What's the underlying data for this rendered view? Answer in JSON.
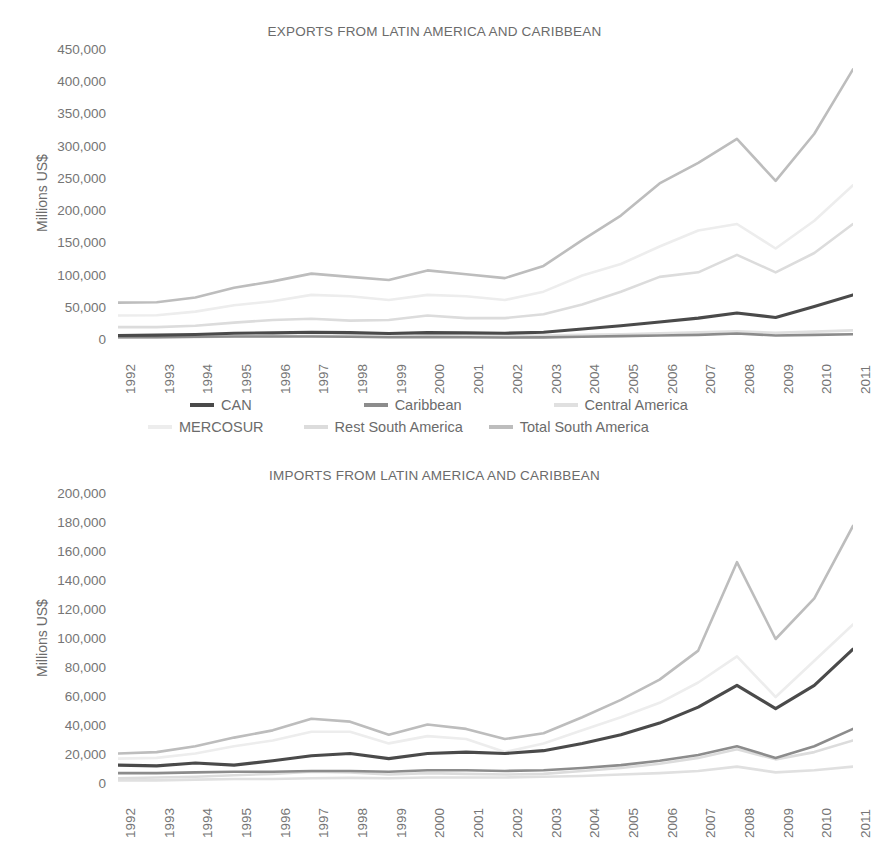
{
  "charts": [
    {
      "id": "exports",
      "title": "EXPORTS FROM LATIN AMERICA AND CARIBBEAN",
      "ylabel": "Millions US$"
    },
    {
      "id": "imports",
      "title": "IMPORTS FROM LATIN AMERICA AND CARIBBEAN",
      "ylabel": "Millions US$"
    }
  ],
  "legend": {
    "row1": [
      {
        "label": "CAN",
        "color": "#4a4a4a"
      },
      {
        "label": "Caribbean",
        "color": "#8c8c8c"
      },
      {
        "label": "Central America",
        "color": "#e0e0e0"
      }
    ],
    "row2": [
      {
        "label": "MERCOSUR",
        "color": "#ededed"
      },
      {
        "label": "Rest South America",
        "color": "#dcdcdc"
      },
      {
        "label": "Total South America",
        "color": "#bdbdbd"
      }
    ]
  },
  "chart_data": [
    {
      "type": "line",
      "title": "EXPORTS FROM LATIN AMERICA AND CARIBBEAN",
      "xlabel": "",
      "ylabel": "Millions US$",
      "ylim": [
        0,
        450000
      ],
      "ytick_step": 50000,
      "yticks": [
        "450,000",
        "400,000",
        "350,000",
        "300,000",
        "250,000",
        "200,000",
        "150,000",
        "100,000",
        "50,000",
        "0"
      ],
      "grid": false,
      "legend_position": "bottom",
      "categories": [
        "1992",
        "1993",
        "1994",
        "1995",
        "1996",
        "1997",
        "1998",
        "1999",
        "2000",
        "2001",
        "2002",
        "2003",
        "2004",
        "2005",
        "2006",
        "2007",
        "2008",
        "2009",
        "2010",
        "2011"
      ],
      "series": [
        {
          "name": "CAN",
          "color": "#4a4a4a",
          "values": [
            7000,
            7500,
            8500,
            10500,
            11000,
            12000,
            11500,
            10000,
            11500,
            11000,
            10500,
            12000,
            17000,
            22000,
            28000,
            34000,
            42000,
            35000,
            52000,
            70000
          ]
        },
        {
          "name": "Caribbean",
          "color": "#8c8c8c",
          "values": [
            4500,
            4500,
            5000,
            5500,
            5500,
            5500,
            5000,
            4200,
            4500,
            4200,
            3800,
            4000,
            5000,
            6000,
            7000,
            8000,
            10000,
            7000,
            8000,
            9000
          ]
        },
        {
          "name": "Central America",
          "color": "#e0e0e0",
          "values": [
            3500,
            4000,
            4500,
            5500,
            6000,
            6500,
            6800,
            6500,
            7000,
            7000,
            6800,
            7000,
            8000,
            9000,
            10500,
            12000,
            13500,
            11000,
            13000,
            15000
          ]
        },
        {
          "name": "MERCOSUR",
          "color": "#ededed",
          "values": [
            38000,
            38500,
            44000,
            54000,
            60000,
            70000,
            68000,
            62000,
            70000,
            68000,
            62000,
            75000,
            100000,
            118000,
            145000,
            170000,
            180000,
            142000,
            185000,
            240000
          ]
        },
        {
          "name": "Rest South America",
          "color": "#dcdcdc",
          "values": [
            20000,
            20000,
            22000,
            27000,
            31000,
            33000,
            30000,
            31000,
            38000,
            34000,
            34000,
            40000,
            55000,
            75000,
            98000,
            105000,
            132000,
            105000,
            135000,
            180000
          ]
        },
        {
          "name": "Total South America",
          "color": "#bdbdbd",
          "values": [
            58000,
            58500,
            66000,
            81000,
            91000,
            103000,
            98000,
            93000,
            108000,
            102000,
            96000,
            115000,
            155000,
            193000,
            243000,
            275000,
            312000,
            247000,
            320000,
            420000
          ]
        }
      ]
    },
    {
      "type": "line",
      "title": "IMPORTS FROM LATIN AMERICA AND CARIBBEAN",
      "xlabel": "",
      "ylabel": "Millions US$",
      "ylim": [
        0,
        200000
      ],
      "ytick_step": 20000,
      "yticks": [
        "200,000",
        "180,000",
        "160,000",
        "140,000",
        "120,000",
        "100,000",
        "80,000",
        "60,000",
        "40,000",
        "20,000",
        "0"
      ],
      "grid": false,
      "legend_position": "shared-above",
      "categories": [
        "1992",
        "1993",
        "1994",
        "1995",
        "1996",
        "1997",
        "1998",
        "1999",
        "2000",
        "2001",
        "2002",
        "2003",
        "2004",
        "2005",
        "2006",
        "2007",
        "2008",
        "2009",
        "2010",
        "2011"
      ],
      "series": [
        {
          "name": "CAN",
          "color": "#4a4a4a",
          "values": [
            13000,
            12500,
            14500,
            13000,
            16000,
            19500,
            21000,
            17500,
            21000,
            22000,
            21000,
            23000,
            28000,
            34000,
            42000,
            53000,
            68000,
            52000,
            68000,
            93000
          ]
        },
        {
          "name": "Caribbean",
          "color": "#8c8c8c",
          "values": [
            7500,
            7500,
            8000,
            8500,
            8500,
            9000,
            9000,
            8500,
            9500,
            9500,
            9000,
            9500,
            11000,
            13000,
            16000,
            20000,
            26000,
            18000,
            26000,
            38000
          ]
        },
        {
          "name": "Central America",
          "color": "#e0e0e0",
          "values": [
            2500,
            2500,
            3000,
            3500,
            3500,
            4000,
            4200,
            4000,
            4500,
            4500,
            4500,
            5000,
            5500,
            6500,
            7500,
            9000,
            12000,
            8000,
            9500,
            12000
          ]
        },
        {
          "name": "MERCOSUR",
          "color": "#ededed",
          "values": [
            17500,
            18000,
            21000,
            26000,
            30000,
            36000,
            36000,
            28000,
            33000,
            31000,
            22000,
            28000,
            37000,
            46000,
            56000,
            70000,
            88000,
            60000,
            85000,
            110000
          ]
        },
        {
          "name": "Rest South America",
          "color": "#dcdcdc",
          "values": [
            4000,
            4500,
            5000,
            6000,
            7000,
            8500,
            8000,
            6500,
            7500,
            7000,
            6500,
            7000,
            9000,
            11000,
            14000,
            18000,
            24000,
            17000,
            22000,
            30000
          ]
        },
        {
          "name": "Total South America",
          "color": "#bdbdbd",
          "values": [
            21000,
            22000,
            26000,
            32000,
            37000,
            45000,
            43000,
            34000,
            41000,
            38000,
            31000,
            35000,
            46000,
            58000,
            72000,
            92000,
            153000,
            100000,
            128000,
            178000
          ]
        }
      ]
    }
  ]
}
